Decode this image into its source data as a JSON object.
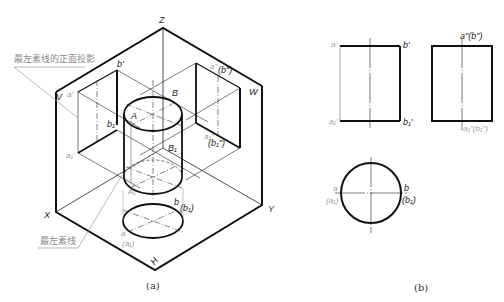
{
  "figure_a": {
    "caption": "(a)",
    "axes": {
      "z": "Z",
      "x": "X",
      "y": "Y"
    },
    "planes": {
      "v": "V",
      "w": "W",
      "h": "H"
    },
    "points": {
      "A": "A",
      "B": "B",
      "A1": "A₁",
      "B1": "B₁",
      "a_prime": "a'",
      "b_prime": "b'",
      "a1_prime": "a₁'",
      "b1_prime": "b₁'",
      "a_dprime": "a\"",
      "b_dprime": "(b\")",
      "a1_dprime": "a₁\"",
      "b1_dprime": "(b₁\")",
      "a": "a",
      "a1": "(a₁)",
      "b": "b",
      "b1": "(b₁)"
    },
    "annotations": {
      "front_projection_of_leftmost_line": "最左素线的正面投影",
      "leftmost_line": "最左素线"
    }
  },
  "figure_b": {
    "caption": "(b)",
    "front_view": {
      "a_prime": "a'",
      "b_prime": "b'",
      "a1_prime": "a₁'",
      "b1_prime": "b₁'"
    },
    "side_view": {
      "top": "a\"(b\")",
      "bottom": "a₁\"(b₁\")"
    },
    "top_view": {
      "a": "a",
      "a1": "(a₁)",
      "b": "b",
      "b1": "(b₁)"
    }
  },
  "colors": {
    "line": "#111111",
    "thin": "#333333",
    "gray_label": "#9a9a9a"
  }
}
